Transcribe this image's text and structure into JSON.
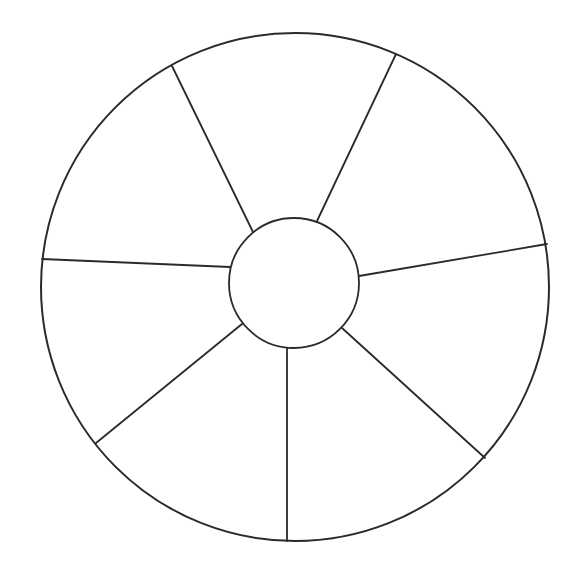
{
  "diagram": {
    "type": "wheel",
    "background": "#ffffff",
    "stroke_color": "#2a2a2a",
    "outer_circle": {
      "cx": 295,
      "cy": 287,
      "r": 254
    },
    "inner_circle": {
      "cx": 294,
      "cy": 283,
      "r": 65
    },
    "segment_count": 7,
    "spokes": [
      {
        "x1": 253,
        "y1": 232,
        "x2": 172,
        "y2": 66
      },
      {
        "x1": 317,
        "y1": 221,
        "x2": 396,
        "y2": 54
      },
      {
        "x1": 359,
        "y1": 276,
        "x2": 547,
        "y2": 244
      },
      {
        "x1": 342,
        "y1": 328,
        "x2": 485,
        "y2": 458
      },
      {
        "x1": 287,
        "y1": 348,
        "x2": 287,
        "y2": 541
      },
      {
        "x1": 242,
        "y1": 324,
        "x2": 96,
        "y2": 443
      },
      {
        "x1": 230,
        "y1": 267,
        "x2": 42,
        "y2": 259
      }
    ],
    "segment_labels": [
      "",
      "",
      "",
      "",
      "",
      "",
      ""
    ],
    "hub_label": ""
  }
}
